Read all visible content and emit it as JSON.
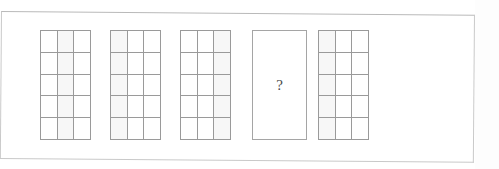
{
  "figure": {
    "kind": "sequence-matrix-puzzle",
    "panel_count": 5,
    "missing_panel_index": 4,
    "missing_marker": "?",
    "grid_columns": 3,
    "grid_rows": 5,
    "colors": {
      "page_background": "#ffffff",
      "frame_border": "#c9c9c9",
      "grid_line": "#9a9a9a",
      "cell_fill": "#ffffff",
      "cell_shaded_fill": "#f7f7f7",
      "question_mark": "#4a4a4a"
    }
  },
  "panels": [
    {
      "id": "panel-1",
      "label": "panel-1",
      "type": "grid",
      "columns": 3,
      "rows": 5,
      "shaded_cells": [
        1,
        4,
        7,
        10,
        13
      ]
    },
    {
      "id": "panel-2",
      "label": "panel-2",
      "type": "grid",
      "columns": 3,
      "rows": 5,
      "shaded_cells": [
        0,
        3,
        6,
        9,
        12
      ]
    },
    {
      "id": "panel-3",
      "label": "panel-3",
      "type": "grid",
      "columns": 3,
      "rows": 5,
      "shaded_cells": [
        2,
        5,
        8,
        11,
        14
      ]
    },
    {
      "id": "panel-4",
      "label": "panel-4",
      "type": "question",
      "marker": "?"
    },
    {
      "id": "panel-5",
      "label": "panel-5",
      "type": "grid",
      "columns": 3,
      "rows": 5,
      "shaded_cells": [
        0,
        3,
        6,
        9,
        12
      ]
    }
  ]
}
